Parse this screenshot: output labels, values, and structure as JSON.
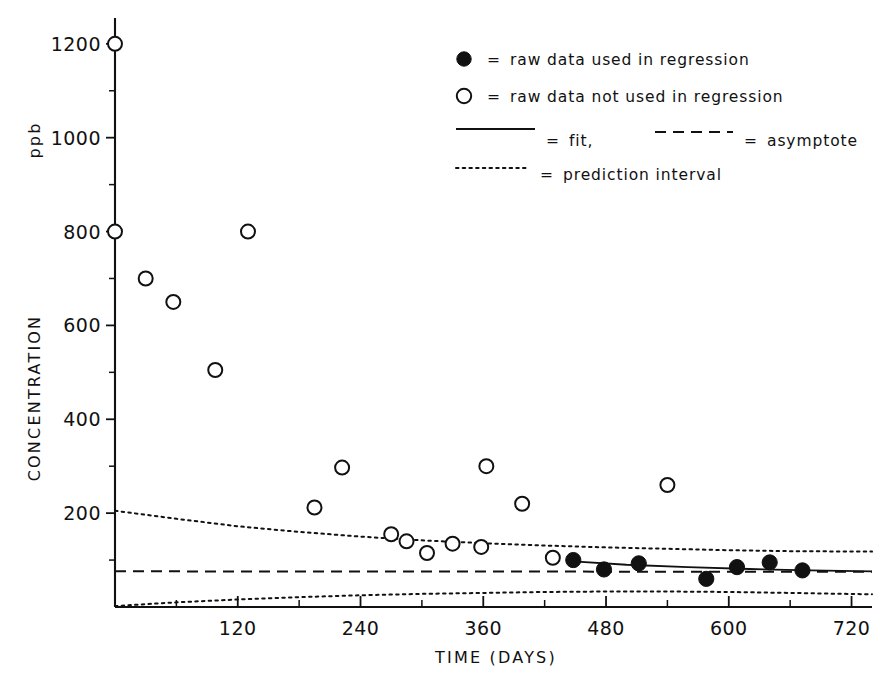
{
  "chart_data": {
    "type": "scatter",
    "title": "",
    "xlabel": "TIME (DAYS)",
    "ylabel": "CONCENTRATION  ppb",
    "ylabel_main": "CONCENTRATION",
    "ylabel_unit": "ppb",
    "xlim": [
      0,
      740
    ],
    "ylim": [
      0,
      1255
    ],
    "xticks": [
      120,
      240,
      360,
      480,
      600,
      720
    ],
    "xtick_labels": [
      "120",
      "240",
      "360",
      "480",
      "600",
      "720"
    ],
    "xticks_minor": [
      60,
      180,
      300,
      420,
      540,
      660
    ],
    "yticks": [
      200,
      400,
      600,
      800,
      1000,
      1200
    ],
    "ytick_labels": [
      "200",
      "400",
      "600",
      "800",
      "1000",
      "1200"
    ],
    "yticks_minor": [
      100,
      300,
      500,
      700,
      900,
      1100
    ],
    "grid": false,
    "legend_position": "top-right",
    "series": [
      {
        "name": "raw data not used in regression",
        "marker": "open-circle",
        "points": [
          [
            0,
            1200
          ],
          [
            0,
            800
          ],
          [
            30,
            700
          ],
          [
            57,
            650
          ],
          [
            98,
            505
          ],
          [
            130,
            800
          ],
          [
            195,
            212
          ],
          [
            222,
            297
          ],
          [
            270,
            155
          ],
          [
            285,
            140
          ],
          [
            305,
            115
          ],
          [
            330,
            135
          ],
          [
            358,
            128
          ],
          [
            363,
            300
          ],
          [
            398,
            220
          ],
          [
            428,
            105
          ],
          [
            540,
            260
          ]
        ]
      },
      {
        "name": "raw data used in regression",
        "marker": "filled-circle",
        "points": [
          [
            448,
            100
          ],
          [
            478,
            80
          ],
          [
            512,
            93
          ],
          [
            578,
            60
          ],
          [
            608,
            85
          ],
          [
            640,
            95
          ],
          [
            672,
            78
          ]
        ]
      }
    ],
    "fit": {
      "name": "fit",
      "style": "solid",
      "points": [
        [
          448,
          97
        ],
        [
          500,
          90
        ],
        [
          560,
          85
        ],
        [
          620,
          81
        ],
        [
          680,
          78
        ],
        [
          740,
          76
        ]
      ]
    },
    "asymptote": {
      "name": "asymptote",
      "style": "dashed",
      "value": 75,
      "points": [
        [
          0,
          76
        ],
        [
          740,
          75
        ]
      ]
    },
    "prediction_interval_upper": {
      "name": "prediction interval",
      "style": "dotted",
      "points": [
        [
          0,
          205
        ],
        [
          60,
          188
        ],
        [
          120,
          172
        ],
        [
          180,
          160
        ],
        [
          240,
          150
        ],
        [
          300,
          142
        ],
        [
          360,
          136
        ],
        [
          420,
          131
        ],
        [
          480,
          127
        ],
        [
          540,
          124
        ],
        [
          600,
          121
        ],
        [
          660,
          119
        ],
        [
          740,
          118
        ]
      ]
    },
    "prediction_interval_lower": {
      "name": "prediction interval",
      "style": "dotted",
      "points": [
        [
          0,
          2
        ],
        [
          60,
          10
        ],
        [
          120,
          16
        ],
        [
          180,
          21
        ],
        [
          240,
          25
        ],
        [
          300,
          28
        ],
        [
          360,
          30
        ],
        [
          420,
          32
        ],
        [
          480,
          33
        ],
        [
          540,
          33
        ],
        [
          600,
          32
        ],
        [
          660,
          30
        ],
        [
          740,
          27
        ]
      ]
    }
  },
  "legend": {
    "entries": [
      {
        "marker": "filled-circle",
        "equals": "=",
        "label": "raw data used in regression"
      },
      {
        "marker": "open-circle",
        "equals": "=",
        "label": "raw data not used in regression"
      },
      {
        "marker": "solid-line",
        "equals": "=",
        "label": "fit,"
      },
      {
        "marker": "dashed-line",
        "equals": "=",
        "label": "asymptote"
      },
      {
        "marker": "dotted-line",
        "equals": "=",
        "label": "prediction interval"
      }
    ]
  }
}
